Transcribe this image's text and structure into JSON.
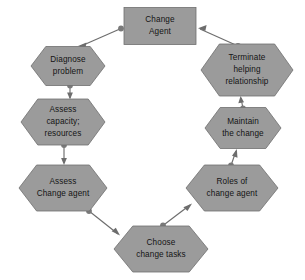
{
  "diagram": {
    "background_color": "#ffffff",
    "node_fill_color": "#9b9b9b",
    "node_stroke_color": "#6f6f6f",
    "connector_color": "#6d6d6d",
    "text_color": "#141414",
    "nodes": [
      {
        "id": "change-agent",
        "shape": "rectangle",
        "lines": [
          "Change",
          "Agent"
        ],
        "line1": "Change",
        "line2": "Agent",
        "line3": "",
        "cx": 160,
        "cy": 26,
        "w": 72,
        "h": 37
      },
      {
        "id": "diagnose-problem",
        "shape": "hexagon",
        "lines": [
          "Diagnose",
          "problem"
        ],
        "line1": "Diagnose",
        "line2": "problem",
        "line3": "",
        "cx": 68,
        "cy": 66,
        "w": 74,
        "h": 39
      },
      {
        "id": "assess-capacity-resources",
        "shape": "hexagon",
        "lines": [
          "Assess",
          "capacity;",
          "resources"
        ],
        "line1": "Assess",
        "line2": "capacity;",
        "line3": "resources",
        "cx": 63,
        "cy": 122,
        "w": 84,
        "h": 46
      },
      {
        "id": "assess-change-agent",
        "shape": "hexagon",
        "lines": [
          "Assess",
          "Change agent"
        ],
        "line1": "Assess",
        "line2": "Change agent",
        "line3": "",
        "cx": 63,
        "cy": 188,
        "w": 88,
        "h": 46
      },
      {
        "id": "choose-change-tasks",
        "shape": "hexagon",
        "lines": [
          "Choose",
          "change tasks"
        ],
        "line1": "Choose",
        "line2": "change tasks",
        "line3": "",
        "cx": 161,
        "cy": 249,
        "w": 94,
        "h": 46
      },
      {
        "id": "roles-of-change-agent",
        "shape": "hexagon",
        "lines": [
          "Roles of",
          "change agent"
        ],
        "line1": "Roles of",
        "line2": "change agent",
        "line3": "",
        "cx": 232,
        "cy": 188,
        "w": 92,
        "h": 46
      },
      {
        "id": "maintain-the-change",
        "shape": "hexagon",
        "lines": [
          "Maintain",
          "the change"
        ],
        "line1": "Maintain",
        "line2": "the change",
        "line3": "",
        "cx": 243,
        "cy": 128,
        "w": 76,
        "h": 41
      },
      {
        "id": "terminate-helping-relationship",
        "shape": "hexagon",
        "lines": [
          "Terminate",
          "helping",
          "relationship"
        ],
        "line1": "Terminate",
        "line2": "helping",
        "line3": "relationship",
        "cx": 247,
        "cy": 70,
        "w": 92,
        "h": 52
      }
    ],
    "connectors": [
      {
        "id": "change-agent-to-diagnose-problem",
        "from": "change-agent",
        "to": "diagnose-problem"
      },
      {
        "id": "diagnose-problem-to-assess-capacity",
        "from": "diagnose-problem",
        "to": "assess-capacity-resources"
      },
      {
        "id": "assess-capacity-to-assess-change-agent",
        "from": "assess-capacity-resources",
        "to": "assess-change-agent"
      },
      {
        "id": "assess-change-agent-to-choose-change-tasks",
        "from": "assess-change-agent",
        "to": "choose-change-tasks"
      },
      {
        "id": "choose-change-tasks-to-roles-of-change-agent",
        "from": "choose-change-tasks",
        "to": "roles-of-change-agent"
      },
      {
        "id": "roles-of-change-agent-to-maintain-the-change",
        "from": "roles-of-change-agent",
        "to": "maintain-the-change"
      },
      {
        "id": "maintain-the-change-to-terminate-helping",
        "from": "maintain-the-change",
        "to": "terminate-helping-relationship"
      },
      {
        "id": "terminate-helping-to-change-agent",
        "from": "terminate-helping-relationship",
        "to": "change-agent"
      }
    ]
  }
}
